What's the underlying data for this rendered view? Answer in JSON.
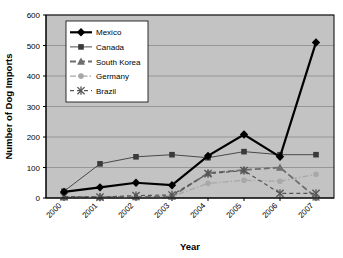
{
  "chart_data": {
    "type": "line",
    "title": "",
    "xlabel": "Year",
    "ylabel": "Number of Dog Imports",
    "categories": [
      "2000",
      "2001",
      "2002",
      "2003",
      "2004",
      "2005",
      "2006",
      "2007"
    ],
    "ylim": [
      0,
      600
    ],
    "ytick_step": 100,
    "yticks": [
      "0",
      "100",
      "200",
      "300",
      "400",
      "500",
      "600"
    ],
    "grid": "horizontal",
    "legend_position": "upper-left-inside",
    "plot_background": "#c3c3c3",
    "figure_background": "#ffffff",
    "series": [
      {
        "name": "Mexico",
        "marker": "diamond",
        "color": "#000000",
        "line_style": "solid",
        "line_width": 2.2,
        "values": [
          20,
          35,
          50,
          42,
          138,
          208,
          135,
          510
        ]
      },
      {
        "name": "Canada",
        "marker": "square",
        "color": "#3a3a3a",
        "line_style": "solid",
        "line_width": 0.9,
        "values": [
          22,
          112,
          135,
          142,
          132,
          152,
          142,
          142
        ]
      },
      {
        "name": "South Korea",
        "marker": "triangle",
        "color": "#6e6e6e",
        "line_style": "dashed",
        "line_width": 1.8,
        "values": [
          2,
          3,
          3,
          5,
          82,
          92,
          100,
          2
        ]
      },
      {
        "name": "Germany",
        "marker": "circle",
        "color": "#a8a8a8",
        "line_style": "dash-dot",
        "line_width": 1.4,
        "values": [
          3,
          2,
          2,
          5,
          48,
          58,
          55,
          78
        ]
      },
      {
        "name": "Brazil",
        "marker": "asterisk",
        "color": "#555555",
        "line_style": "dashed",
        "line_width": 1.2,
        "values": [
          5,
          3,
          8,
          10,
          80,
          90,
          15,
          15
        ]
      }
    ]
  }
}
